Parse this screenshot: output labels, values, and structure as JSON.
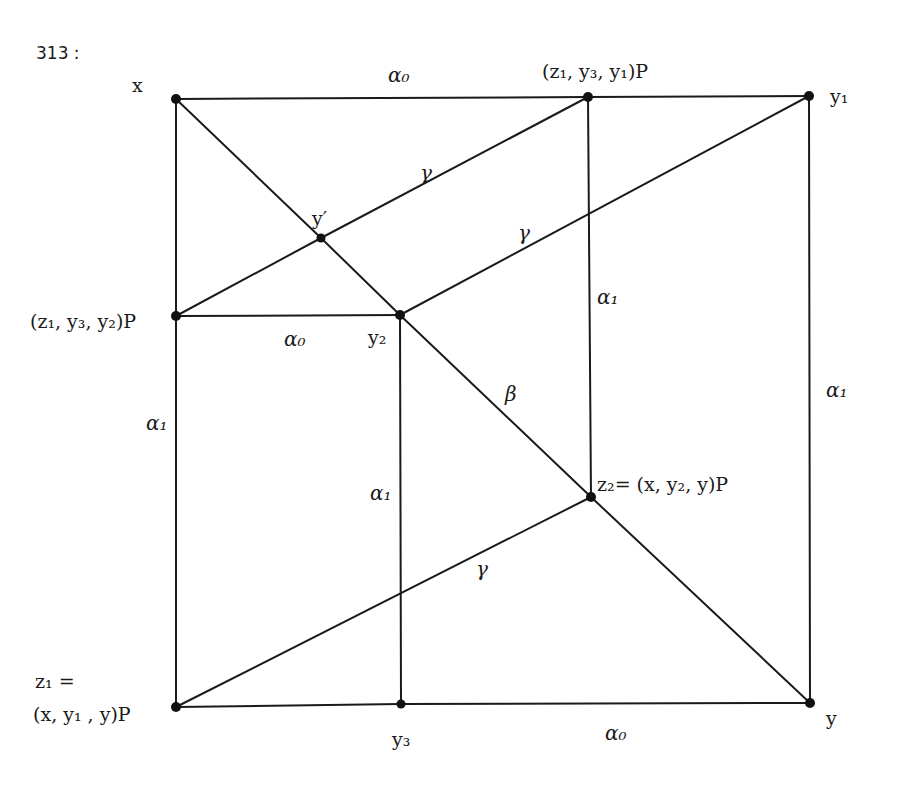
{
  "figure": {
    "number_label": "313 :"
  },
  "nodes": [
    {
      "id": "x",
      "label": "x"
    },
    {
      "id": "p_top",
      "label": "(z₁, y₃, y₁)P"
    },
    {
      "id": "y1",
      "label": "y₁"
    },
    {
      "id": "yprime",
      "label": "y′"
    },
    {
      "id": "p_left",
      "label": "(z₁, y₃, y₂)P"
    },
    {
      "id": "y2",
      "label": "y₂"
    },
    {
      "id": "z2",
      "label": "z₂= (x, y₂, y)P"
    },
    {
      "id": "z1",
      "label_line1": "z₁ =",
      "label_line2": "(x, y₁ , y)P"
    },
    {
      "id": "y3",
      "label": "y₃"
    },
    {
      "id": "y",
      "label": "y"
    }
  ],
  "edges": [
    {
      "from": "x",
      "to": "p_top",
      "label": "α₀"
    },
    {
      "from": "p_top",
      "to": "y1",
      "label": ""
    },
    {
      "from": "x",
      "to": "p_left",
      "label": ""
    },
    {
      "from": "p_left",
      "to": "z1",
      "label": "α₁"
    },
    {
      "from": "y1",
      "to": "y",
      "label": "α₁"
    },
    {
      "from": "z1",
      "to": "y3",
      "label": ""
    },
    {
      "from": "y3",
      "to": "y",
      "label": "α₀"
    },
    {
      "from": "p_left",
      "to": "y2",
      "label": "α₀"
    },
    {
      "from": "y2",
      "to": "y3",
      "label": "α₁"
    },
    {
      "from": "p_top",
      "to": "z2",
      "label": "α₁"
    },
    {
      "from": "x",
      "to": "yprime",
      "label": ""
    },
    {
      "from": "yprime",
      "to": "y2",
      "label": ""
    },
    {
      "from": "y2",
      "to": "z2",
      "label": "β"
    },
    {
      "from": "z2",
      "to": "y",
      "label": ""
    },
    {
      "from": "p_left",
      "to": "yprime",
      "label": ""
    },
    {
      "from": "yprime",
      "to": "p_top",
      "label": "γ"
    },
    {
      "from": "y2",
      "to": "y1",
      "label": "γ"
    },
    {
      "from": "z1",
      "to": "z2",
      "label": "γ"
    }
  ],
  "edge_labels": {
    "top_alpha0": "α₀",
    "gamma_upper": "γ",
    "gamma_middle": "γ",
    "alpha1_center": "α₁",
    "alpha1_right": "α₁",
    "alpha0_middle": "α₀",
    "beta": "β",
    "alpha1_left": "α₁",
    "alpha1_inner": "α₁",
    "gamma_lower": "γ",
    "alpha0_bottom": "α₀"
  }
}
